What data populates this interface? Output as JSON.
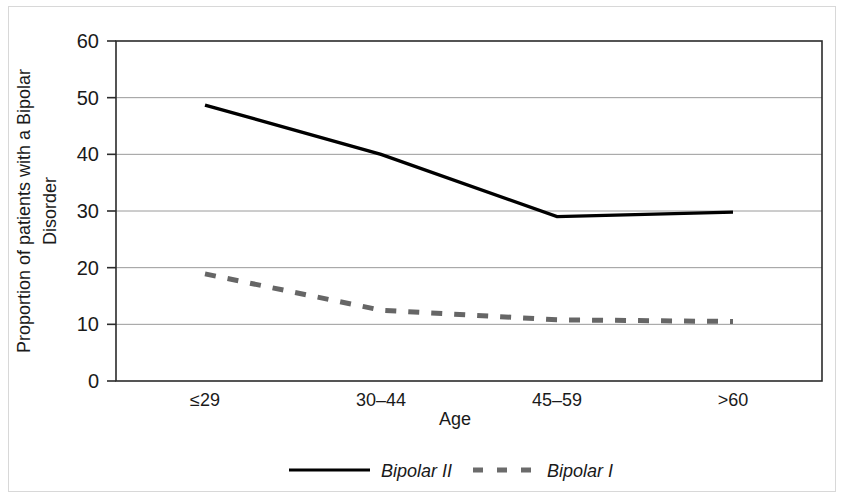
{
  "chart_data": {
    "type": "line",
    "title": "",
    "xlabel": "Age",
    "ylabel": "Proportion of patients with a Bipolar Disorder",
    "ylabel_line1": "Proportion of patients with a Bipolar",
    "ylabel_line2": "Disorder",
    "categories": [
      "≤29",
      "30–44",
      "45–59",
      ">60"
    ],
    "series": [
      {
        "name": "Bipolar II",
        "style": "solid",
        "color": "#000000",
        "values": [
          48.7,
          40.0,
          29.0,
          29.8
        ]
      },
      {
        "name": "Bipolar I",
        "style": "dashed",
        "color": "#666666",
        "values": [
          18.9,
          12.5,
          10.8,
          10.5
        ]
      }
    ],
    "ylim": [
      0,
      60
    ],
    "ytick_values": [
      0,
      10,
      20,
      30,
      40,
      50,
      60
    ],
    "ytick_labels": [
      "0",
      "10",
      "20",
      "30",
      "40",
      "50",
      "60"
    ],
    "grid": true,
    "grid_axis": "y",
    "legend_position": "bottom"
  },
  "legend": {
    "entries": [
      {
        "label": "Bipolar II",
        "style": "solid"
      },
      {
        "label": "Bipolar I",
        "style": "dashed"
      }
    ]
  }
}
